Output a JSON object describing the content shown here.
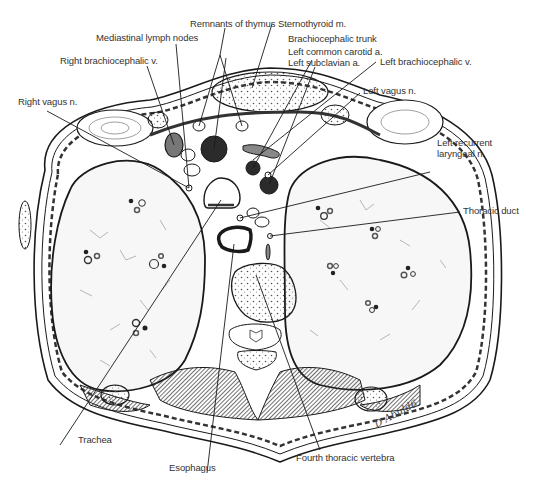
{
  "figure": {
    "signature": "D Abuld6",
    "colors": {
      "ink": "#1a1a1a",
      "lung_fill": "#f6f6f6",
      "vessel_dark": "#2b2b2b",
      "muscle_dark": "#4a4a4a",
      "label_text": "#333333"
    }
  },
  "labels": {
    "remnants_of_thymus": "Remnants of thymus",
    "sternothyroid": "Sternothyroid m.",
    "mediastinal_lymph_nodes": "Mediastinal lymph nodes",
    "brachiocephalic_trunk": "Brachiocephalic trunk",
    "left_common_carotid": "Left common carotid a.",
    "left_subclavian": "Left subclavian a.",
    "right_brachiocephalic_v": "Right brachiocephalic v.",
    "left_brachiocephalic_v": "Left brachiocephalic v.",
    "right_vagus": "Right vagus n.",
    "left_vagus": "Left vagus n.",
    "left_recurrent_line1": "Left recurrent",
    "left_recurrent_line2": "laryngeal n.",
    "thoracic_duct": "Thoracic duct",
    "trachea": "Trachea",
    "esophagus": "Esophagus",
    "fourth_thoracic_vertebra": "Fourth thoracic vertebra"
  }
}
